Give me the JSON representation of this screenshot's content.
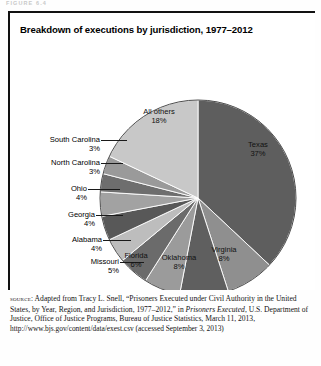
{
  "figure": {
    "ghost_caption": "FIGURE 6.4",
    "title": "Breakdown of executions by jurisdiction, 1977–2012"
  },
  "chart_data": {
    "type": "pie",
    "title": "Breakdown of executions by jurisdiction, 1977–2012",
    "xlabel": "",
    "ylabel": "",
    "legend": "none",
    "units": "percent",
    "start_angle_deg": 0,
    "direction": "clockwise",
    "categories": [
      "Texas",
      "Virginia",
      "Oklahoma",
      "Florida",
      "Missouri",
      "Alabama",
      "Georgia",
      "Ohio",
      "North Carolina",
      "South Carolina",
      "All others"
    ],
    "values": [
      37,
      8,
      8,
      6,
      5,
      4,
      4,
      4,
      3,
      3,
      18
    ],
    "slices": [
      {
        "label": "Texas",
        "pct": 37,
        "pct_text": "37%",
        "color": "#5e5e5e",
        "label_placement": "inside"
      },
      {
        "label": "Virginia",
        "pct": 8,
        "pct_text": "8%",
        "color": "#8f8f8f",
        "label_placement": "inside"
      },
      {
        "label": "Oklahoma",
        "pct": 8,
        "pct_text": "8%",
        "color": "#5f5f5f",
        "label_placement": "inside"
      },
      {
        "label": "Florida",
        "pct": 6,
        "pct_text": "6%",
        "color": "#9b9b9b",
        "label_placement": "inside"
      },
      {
        "label": "Missouri",
        "pct": 5,
        "pct_text": "5%",
        "color": "#6b6b6b",
        "label_placement": "outside"
      },
      {
        "label": "Alabama",
        "pct": 4,
        "pct_text": "4%",
        "color": "#bdbdbd",
        "label_placement": "outside"
      },
      {
        "label": "Georgia",
        "pct": 4,
        "pct_text": "4%",
        "color": "#585858",
        "label_placement": "outside"
      },
      {
        "label": "Ohio",
        "pct": 4,
        "pct_text": "4%",
        "color": "#a2a2a2",
        "label_placement": "outside"
      },
      {
        "label": "North Carolina",
        "pct": 3,
        "pct_text": "3%",
        "color": "#6e6e6e",
        "label_placement": "outside"
      },
      {
        "label": "South Carolina",
        "pct": 3,
        "pct_text": "3%",
        "color": "#9a9a9a",
        "label_placement": "outside"
      },
      {
        "label": "All others",
        "pct": 18,
        "pct_text": "18%",
        "color": "#c8c8c8",
        "label_placement": "inside"
      }
    ]
  },
  "source": {
    "prefix": "source:",
    "line1": " Adapted from Tracy L. Snell, “Prisoners Executed under Civil Authority in the United States, by Year, Region, and Jurisdiction, 1977–2012,” in ",
    "italic1": "Prisoners Executed",
    "line2": ", U.S. Department of Justice, Office of Justice Programs, Bureau of Justice Statistics, March 11, 2013, ",
    "url": "http://www.bjs.gov/content/data/exest.csv (accessed September 3, 2013)"
  }
}
